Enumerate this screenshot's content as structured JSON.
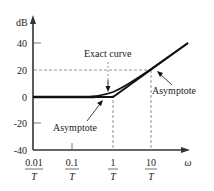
{
  "figure": {
    "type": "bode-magnitude-plot",
    "y_axis": {
      "label": "dB",
      "ticks": [
        "40",
        "20",
        "0",
        "-20",
        "-40"
      ]
    },
    "x_axis": {
      "label": "ω",
      "ticks": [
        {
          "num": "0.01",
          "den": "T"
        },
        {
          "num": "0.1",
          "den": "T"
        },
        {
          "num": "1",
          "den": "T"
        },
        {
          "num": "10",
          "den": "T"
        }
      ]
    },
    "annotations": {
      "exact_curve": "Exact curve",
      "asymptote_low": "Asymptote",
      "asymptote_high": "Asymptote"
    },
    "colors": {
      "line": "#111111",
      "dashed": "#777777",
      "text": "#222222"
    }
  }
}
